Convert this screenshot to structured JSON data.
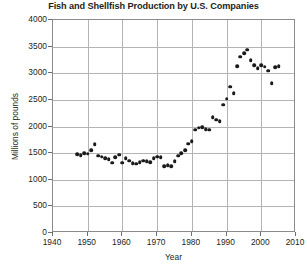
{
  "chart_data": {
    "type": "scatter",
    "title": "Fish and Shellfish Production by U.S. Companies",
    "xlabel": "Year",
    "ylabel": "Millions of pounds",
    "xlim": [
      1940,
      2010
    ],
    "ylim": [
      0,
      4000
    ],
    "xticks": [
      1940,
      1950,
      1960,
      1970,
      1980,
      1990,
      2000,
      2010
    ],
    "yticks": [
      0,
      500,
      1000,
      1500,
      2000,
      2500,
      3000,
      3500,
      4000
    ],
    "grid": true,
    "legend": null,
    "marker": "filled-circle",
    "marker_color": "#1a1a1a",
    "series": [
      {
        "name": "Fish and shellfish production",
        "points": [
          [
            1947,
            1480
          ],
          [
            1948,
            1460
          ],
          [
            1949,
            1500
          ],
          [
            1950,
            1490
          ],
          [
            1951,
            1550
          ],
          [
            1952,
            1670
          ],
          [
            1953,
            1450
          ],
          [
            1954,
            1430
          ],
          [
            1955,
            1400
          ],
          [
            1956,
            1390
          ],
          [
            1957,
            1320
          ],
          [
            1958,
            1420
          ],
          [
            1959,
            1470
          ],
          [
            1960,
            1320
          ],
          [
            1961,
            1400
          ],
          [
            1962,
            1360
          ],
          [
            1963,
            1310
          ],
          [
            1964,
            1300
          ],
          [
            1965,
            1330
          ],
          [
            1966,
            1360
          ],
          [
            1967,
            1350
          ],
          [
            1968,
            1330
          ],
          [
            1969,
            1400
          ],
          [
            1970,
            1430
          ],
          [
            1971,
            1420
          ],
          [
            1972,
            1250
          ],
          [
            1973,
            1270
          ],
          [
            1974,
            1250
          ],
          [
            1975,
            1350
          ],
          [
            1976,
            1450
          ],
          [
            1977,
            1500
          ],
          [
            1978,
            1560
          ],
          [
            1979,
            1680
          ],
          [
            1980,
            1720
          ],
          [
            1981,
            1940
          ],
          [
            1982,
            1980
          ],
          [
            1983,
            1990
          ],
          [
            1984,
            1950
          ],
          [
            1985,
            1940
          ],
          [
            1986,
            2180
          ],
          [
            1987,
            2130
          ],
          [
            1988,
            2100
          ],
          [
            1989,
            2410
          ],
          [
            1990,
            2520
          ],
          [
            1991,
            2750
          ],
          [
            1992,
            2630
          ],
          [
            1993,
            3130
          ],
          [
            1994,
            3310
          ],
          [
            1995,
            3380
          ],
          [
            1996,
            3440
          ],
          [
            1997,
            3250
          ],
          [
            1998,
            3150
          ],
          [
            1999,
            3100
          ],
          [
            2000,
            3150
          ],
          [
            2001,
            3120
          ],
          [
            2002,
            3050
          ],
          [
            2003,
            2810
          ],
          [
            2004,
            3110
          ],
          [
            2005,
            3130
          ]
        ]
      }
    ]
  }
}
